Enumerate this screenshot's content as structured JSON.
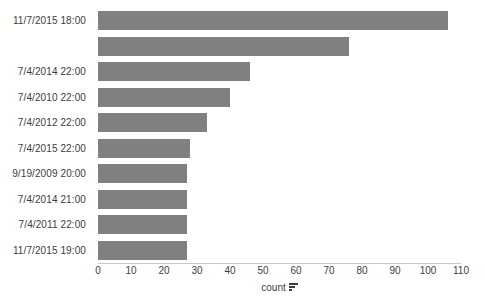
{
  "chart_data": {
    "type": "bar",
    "orientation": "horizontal",
    "title": "",
    "xlabel": "count",
    "ylabel": "",
    "xlim": [
      0,
      110
    ],
    "xticks": [
      0,
      10,
      20,
      30,
      40,
      50,
      60,
      70,
      80,
      90,
      100,
      110
    ],
    "grid": false,
    "legend": null,
    "bar_color": "#808080",
    "categories": [
      "11/7/2015 18:00",
      "",
      "7/4/2014 22:00",
      "7/4/2010 22:00",
      "7/4/2012 22:00",
      "7/4/2015 22:00",
      "9/19/2009 20:00",
      "7/4/2014 21:00",
      "7/4/2011 22:00",
      "11/7/2015 19:00"
    ],
    "values": [
      106,
      76,
      46,
      40,
      33,
      28,
      27,
      27,
      27,
      27
    ]
  },
  "axis": {
    "x_title_text": "count",
    "x_title_icon": "sort-descending-icon",
    "tick_labels": [
      "0",
      "10",
      "20",
      "30",
      "40",
      "50",
      "60",
      "70",
      "80",
      "90",
      "100",
      "110"
    ]
  },
  "labels": {
    "row0": "11/7/2015 18:00",
    "row1": "",
    "row2": "7/4/2014 22:00",
    "row3": "7/4/2010 22:00",
    "row4": "7/4/2012 22:00",
    "row5": "7/4/2015 22:00",
    "row6": "9/19/2009 20:00",
    "row7": "7/4/2014 21:00",
    "row8": "7/4/2011 22:00",
    "row9": "11/7/2015 19:00"
  }
}
